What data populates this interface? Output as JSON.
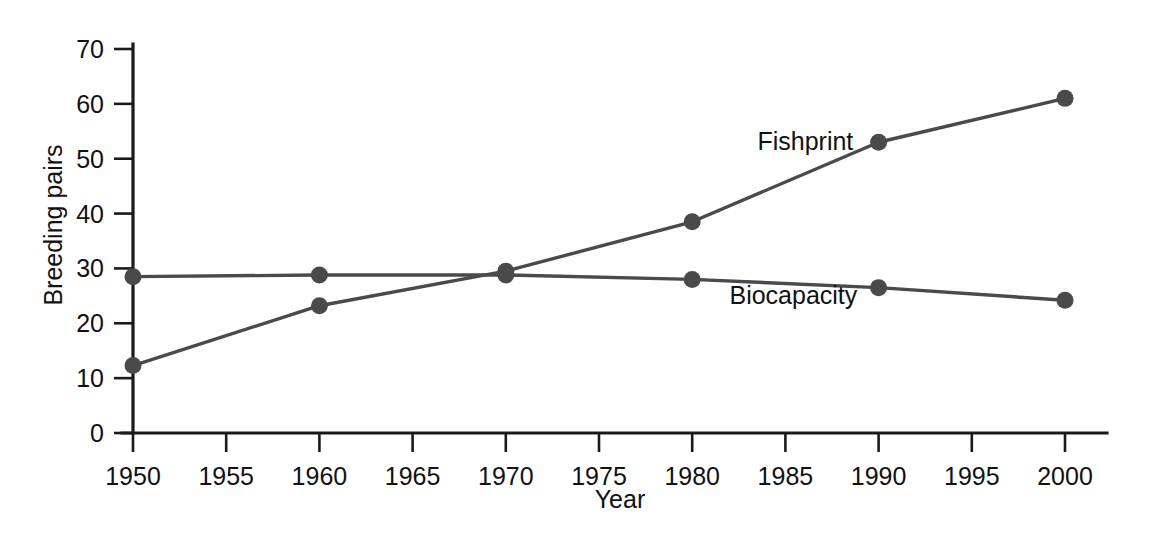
{
  "chart_data": {
    "type": "line",
    "title": "",
    "subtitle": "",
    "xlabel": "Year",
    "ylabel": "Breeding pairs",
    "x": [
      1950,
      1960,
      1970,
      1980,
      1990,
      2000
    ],
    "xlim": [
      1950,
      2002
    ],
    "ylim": [
      0,
      70
    ],
    "xticks": [
      1950,
      1955,
      1960,
      1965,
      1970,
      1975,
      1980,
      1985,
      1990,
      1995,
      2000
    ],
    "xticklabels": [
      "1950",
      "1955",
      "1960",
      "1965",
      "1970",
      "1975",
      "1980",
      "1985",
      "1990",
      "1995",
      "2000"
    ],
    "yticks": [
      0,
      10,
      20,
      30,
      40,
      50,
      60,
      70
    ],
    "yticklabels": [
      "0",
      "10",
      "20",
      "30",
      "40",
      "50",
      "60",
      "70"
    ],
    "grid": false,
    "legend_position": "inline-annotation",
    "series": [
      {
        "name": "Fishprint",
        "color": "#4a4a4a",
        "marker": "circle",
        "values": [
          12.3,
          23.2,
          29.5,
          38.5,
          53.0,
          61.0
        ],
        "label_x": 1983.5,
        "label_y": 51.5
      },
      {
        "name": "Biocapacity",
        "color": "#4a4a4a",
        "marker": "circle",
        "values": [
          28.5,
          28.8,
          28.8,
          28.0,
          26.5,
          24.2
        ],
        "label_x": 1982.0,
        "label_y": 23.5
      }
    ],
    "annotations": [
      {
        "text": "Fishprint",
        "x": 1983.5,
        "y": 51.5
      },
      {
        "text": "Biocapacity",
        "x": 1982.0,
        "y": 23.5
      }
    ]
  },
  "axis": {
    "x_title": "Year",
    "y_title": "Breeding pairs"
  },
  "colors": {
    "axis": "#1a1a1a",
    "series": "#4a4a4a",
    "background": "#ffffff",
    "text": "#111111"
  }
}
